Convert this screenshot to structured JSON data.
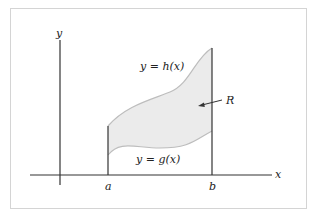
{
  "figure": {
    "axes": {
      "x_label": "x",
      "y_label": "y"
    },
    "bounds": {
      "left_label": "a",
      "right_label": "b"
    },
    "curves": {
      "upper": {
        "label_lhs": "y = ",
        "label_fn": "h(x)",
        "full": "y = h(x)"
      },
      "lower": {
        "label_lhs": "y = ",
        "label_fn": "g(x)",
        "full": "y = g(x)"
      }
    },
    "region": {
      "label": "R",
      "fill_color": "#ebebeb",
      "edge_color": "#bdbdbd"
    },
    "colors": {
      "frame": "#d4d4d4",
      "axis": "#333333"
    }
  }
}
